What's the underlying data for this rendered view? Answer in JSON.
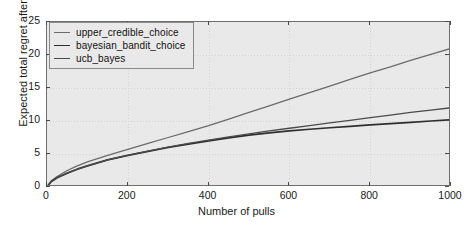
{
  "chart_data": {
    "type": "line",
    "title": "",
    "xlabel": "Number of pulls",
    "ylabel": "Expected total regret after n pulls",
    "ylabel_italic_part": "n",
    "xlim": [
      0,
      1000
    ],
    "ylim": [
      0,
      25
    ],
    "xticks": [
      0,
      200,
      400,
      600,
      800,
      1000
    ],
    "yticks": [
      0,
      5,
      10,
      15,
      20,
      25
    ],
    "xtick_labels": [
      "0",
      "200",
      "400",
      "600",
      "800",
      "1000"
    ],
    "ytick_labels": [
      "0",
      "5",
      "10",
      "15",
      "20",
      "25"
    ],
    "grid": true,
    "grid_style": "dotted",
    "legend_position": "upper left",
    "plot_background": "#e9e9e9",
    "figure_background": "#ffffff",
    "x": [
      0,
      10,
      25,
      50,
      75,
      100,
      150,
      200,
      250,
      300,
      350,
      400,
      450,
      500,
      550,
      600,
      650,
      700,
      750,
      800,
      850,
      900,
      950,
      1000
    ],
    "series": [
      {
        "name": "upper_credible_choice",
        "color": "#6b6b6b",
        "line_width": 1.3,
        "values": [
          0,
          0.9,
          1.6,
          2.5,
          3.2,
          3.8,
          4.8,
          5.7,
          6.6,
          7.5,
          8.4,
          9.3,
          10.3,
          11.3,
          12.3,
          13.3,
          14.3,
          15.3,
          16.3,
          17.3,
          18.2,
          19.2,
          20.1,
          21.0
        ]
      },
      {
        "name": "bayesian_bandit_choice",
        "color": "#2e2e2e",
        "line_width": 1.7,
        "values": [
          0,
          0.8,
          1.4,
          2.1,
          2.7,
          3.2,
          4.1,
          4.8,
          5.4,
          6.0,
          6.5,
          7.0,
          7.45,
          7.85,
          8.2,
          8.5,
          8.75,
          8.98,
          9.2,
          9.4,
          9.6,
          9.8,
          10.0,
          10.2
        ]
      },
      {
        "name": "ucb_bayes",
        "color": "#4a4a4a",
        "line_width": 1.3,
        "values": [
          0,
          0.8,
          1.4,
          2.1,
          2.7,
          3.2,
          4.1,
          4.8,
          5.45,
          6.05,
          6.6,
          7.1,
          7.6,
          8.05,
          8.5,
          8.9,
          9.3,
          9.7,
          10.1,
          10.5,
          10.9,
          11.3,
          11.65,
          12.0
        ]
      }
    ]
  },
  "legend": {
    "items": [
      {
        "label": "upper_credible_choice",
        "color": "#6b6b6b",
        "width": 1.3
      },
      {
        "label": "bayesian_bandit_choice",
        "color": "#2e2e2e",
        "width": 1.9
      },
      {
        "label": "ucb_bayes",
        "color": "#4a4a4a",
        "width": 1.3
      }
    ]
  }
}
